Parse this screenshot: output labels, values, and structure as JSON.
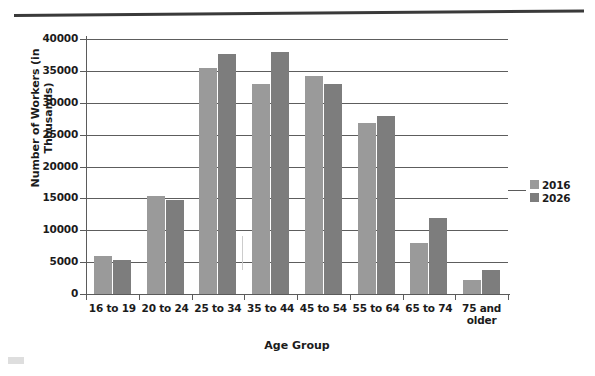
{
  "figure": {
    "top_rule": "horizontal-rule"
  },
  "chart_data": {
    "type": "bar",
    "title": "",
    "xlabel": "Age Group",
    "ylabel": "Number of Workers (in Thousands)",
    "categories": [
      "16 to 19",
      "20 to 24",
      "25 to 34",
      "35 to 44",
      "45 to 54",
      "55 to 64",
      "65 to 74",
      "75 and older"
    ],
    "series": [
      {
        "name": "2016",
        "color": "#9a9a9a",
        "values": [
          6000,
          15400,
          35500,
          33000,
          34200,
          26800,
          8000,
          2200
        ]
      },
      {
        "name": "2026",
        "color": "#7d7d7d",
        "values": [
          5300,
          14700,
          37600,
          37900,
          33000,
          28000,
          12000,
          3800
        ]
      }
    ],
    "ylim": [
      0,
      40000
    ],
    "yticks": [
      0,
      5000,
      10000,
      15000,
      20000,
      25000,
      30000,
      35000,
      40000
    ],
    "ytick_labels": [
      "0",
      "5000",
      "10000",
      "15000",
      "20000",
      "25000",
      "30000",
      "35000",
      "40000"
    ],
    "grid": true,
    "legend_position": "right"
  }
}
